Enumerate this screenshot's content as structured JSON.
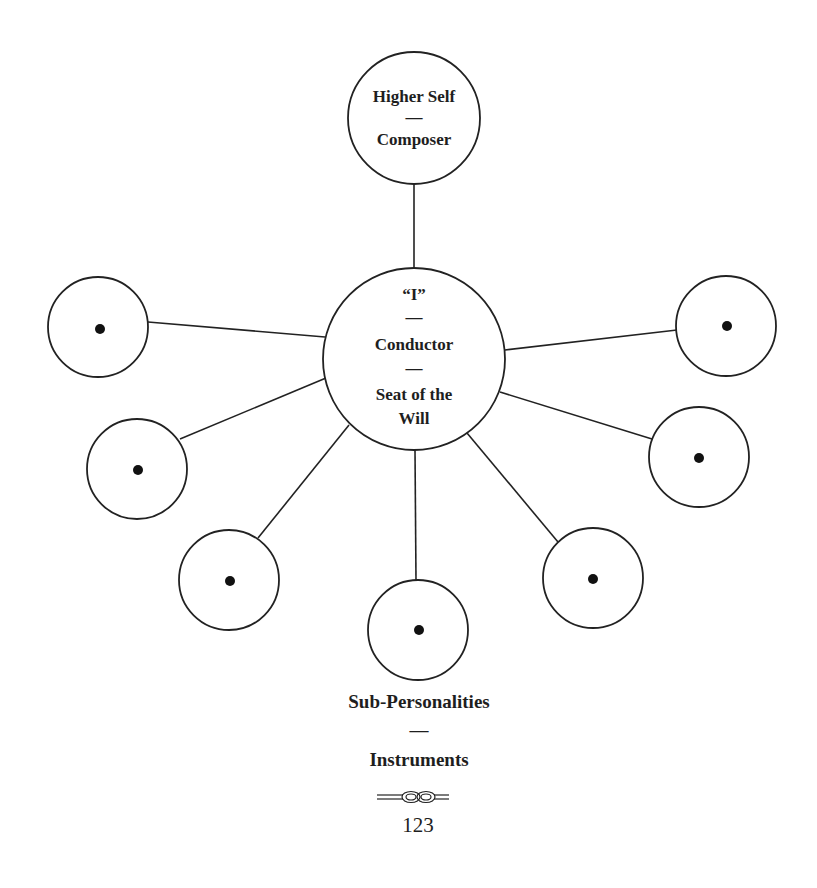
{
  "diagram": {
    "colors": {
      "ink": "#1e1e1e",
      "background": "#ffffff"
    },
    "top_node": {
      "line1": "Higher Self",
      "line2": "—",
      "line3": "Composer",
      "cx": 414,
      "cy": 118,
      "r": 66
    },
    "center_node": {
      "line1": "“I”",
      "line2": "—",
      "line3": "Conductor",
      "line4": "—",
      "line5": "Seat of the",
      "line6": "Will",
      "cx": 414,
      "cy": 359,
      "r": 91
    },
    "sub_nodes": [
      {
        "id": "left-top",
        "cx": 98,
        "cy": 327,
        "r": 50
      },
      {
        "id": "left-middle",
        "cx": 137,
        "cy": 469,
        "r": 50
      },
      {
        "id": "left-bottom",
        "cx": 229,
        "cy": 580,
        "r": 50
      },
      {
        "id": "bottom",
        "cx": 418,
        "cy": 630,
        "r": 50
      },
      {
        "id": "right-bottom",
        "cx": 593,
        "cy": 578,
        "r": 50
      },
      {
        "id": "right-middle",
        "cx": 699,
        "cy": 457,
        "r": 50
      },
      {
        "id": "right-top",
        "cx": 726,
        "cy": 326,
        "r": 50
      }
    ],
    "caption": {
      "line1": "Sub-Personalities",
      "line2": "—",
      "line3": "Instruments"
    }
  },
  "footer": {
    "ornament": "knot-ornament",
    "page_number": "123"
  }
}
